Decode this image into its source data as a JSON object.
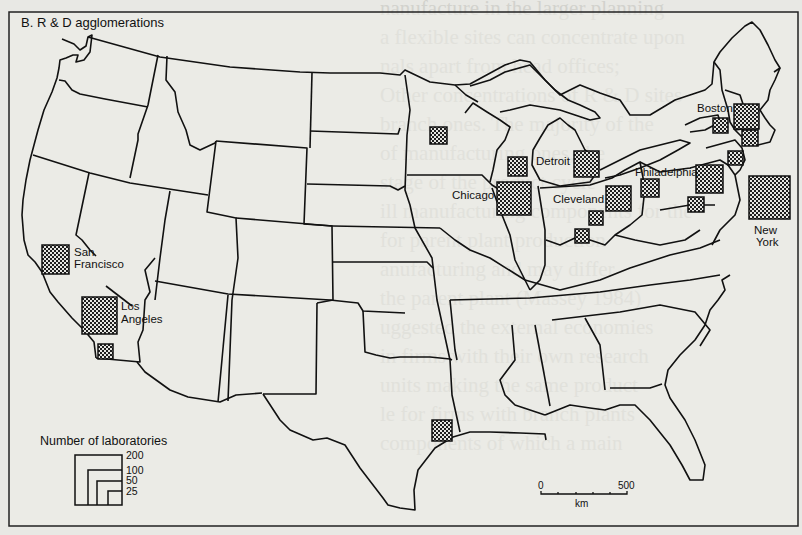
{
  "figure": {
    "title": "B. R & D agglomerations",
    "legend": {
      "title": "Number of laboratories",
      "levels": [
        200,
        100,
        50,
        25
      ]
    },
    "scale_bar": {
      "start_label": "0",
      "end_label": "500",
      "unit": "km"
    },
    "symbol_fill": "#2a2a2a",
    "border_color": "#111111"
  },
  "chart_data": {
    "type": "proportional-symbol-map",
    "title": "B. R & D agglomerations",
    "legend_title": "Number of laboratories",
    "legend_levels": [
      200,
      100,
      50,
      25
    ],
    "symbols": [
      {
        "label": "San Francisco",
        "labs_approx": 100
      },
      {
        "label": "Los Angeles",
        "labs_approx": 150
      },
      {
        "label": "",
        "region": "San Diego",
        "labs_approx": 25
      },
      {
        "label": "",
        "region": "Minneapolis",
        "labs_approx": 25
      },
      {
        "label": "",
        "region": "Milwaukee",
        "labs_approx": 35
      },
      {
        "label": "Chicago",
        "labs_approx": 200
      },
      {
        "label": "Detroit",
        "labs_approx": 80
      },
      {
        "label": "Cleveland",
        "labs_approx": 80
      },
      {
        "label": "",
        "region": "Columbus",
        "labs_approx": 25
      },
      {
        "label": "",
        "region": "Cincinnati",
        "labs_approx": 25
      },
      {
        "label": "",
        "region": "Pittsburgh",
        "labs_approx": 35
      },
      {
        "label": "Philadelphia",
        "labs_approx": 100
      },
      {
        "label": "",
        "region": "Baltimore/Washington",
        "labs_approx": 30
      },
      {
        "label": "Boston",
        "labs_approx": 100
      },
      {
        "label": "",
        "region": "Albany",
        "labs_approx": 25
      },
      {
        "label": "",
        "region": "Providence/Hartford",
        "labs_approx": 30
      },
      {
        "label": "",
        "region": "New Haven",
        "labs_approx": 30
      },
      {
        "label": "New York",
        "labs_approx": 300
      },
      {
        "label": "",
        "region": "Houston",
        "labs_approx": 25
      }
    ]
  },
  "background_text": {
    "lines_left": [
      "nanufacture in the larger planning",
      "a flexible sites can concentrate upon",
      "nals apart from head offices;",
      "Other concentrations of R & D sites",
      "branch ones. The majority of the",
      "of manufacturing ones, the",
      "stage of the product cycle",
      "ill manufacturing components for the",
      "for parent plant production",
      "anufacturing and may differ",
      "the parent plant (Massey 1984)",
      "uggested the external economies",
      "in firms with their own research",
      "units making the same product",
      "le for firms with branch plants",
      "components of which a main"
    ],
    "lines_right": [
      "main production sites and the R & D",
      "and arises partly as their different",
      "different functions, which can be",
      "arguments about the operation",
      "Chapter 2 and will be",
      "cut types of labour which are",
      "Chapter 2.",
      "The locational hierarchy of R & D",
      "ment is illustrated by the case",
      "of the white-collar staff it contains,",
      "al and the many establishments which",
      "its head office etc. Some of the",
      "& D establishments are concentrated",
      "number of areas.",
      "Studies of the location of the largest",
      "largest a corporation, the greater",
      "establishments there are in central"
    ]
  }
}
